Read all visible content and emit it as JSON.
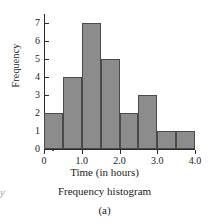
{
  "chart_data": {
    "type": "bar",
    "title": "",
    "xlabel": "Time (in hours)",
    "ylabel": "Frequency",
    "categories": [
      "0.0-0.5",
      "0.5-1.0",
      "1.0-1.5",
      "1.5-2.0",
      "2.0-2.5",
      "2.5-3.0",
      "3.0-3.5",
      "3.5-4.0"
    ],
    "bin_edges": [
      0,
      0.5,
      1.0,
      1.5,
      2.0,
      2.5,
      3.0,
      3.5,
      4.0
    ],
    "values": [
      2,
      4,
      7,
      5,
      2,
      3,
      1,
      1
    ],
    "bin_width": 0.5,
    "xlim": [
      0,
      4.0
    ],
    "ylim": [
      0,
      7.5
    ],
    "x_tick_labels": [
      "0",
      "1.0",
      "2.0",
      "3.0",
      "4.0"
    ],
    "x_tick_values": [
      0,
      1.0,
      2.0,
      3.0,
      4.0
    ],
    "y_tick_labels": [
      "0",
      "1",
      "2",
      "3",
      "4",
      "5",
      "6",
      "7"
    ],
    "y_tick_values": [
      0,
      1,
      2,
      3,
      4,
      5,
      6,
      7
    ],
    "grid": false,
    "legend": false,
    "bar_color": "#8c8c8c",
    "bar_edge_color": "#4a4a4a",
    "axis_color": "#2b2b2b",
    "axis_break": "x-axis-break-symbol"
  },
  "figure": {
    "caption": "Frequency histogram",
    "subcaption": "(a)",
    "edge_artifact": "y"
  }
}
